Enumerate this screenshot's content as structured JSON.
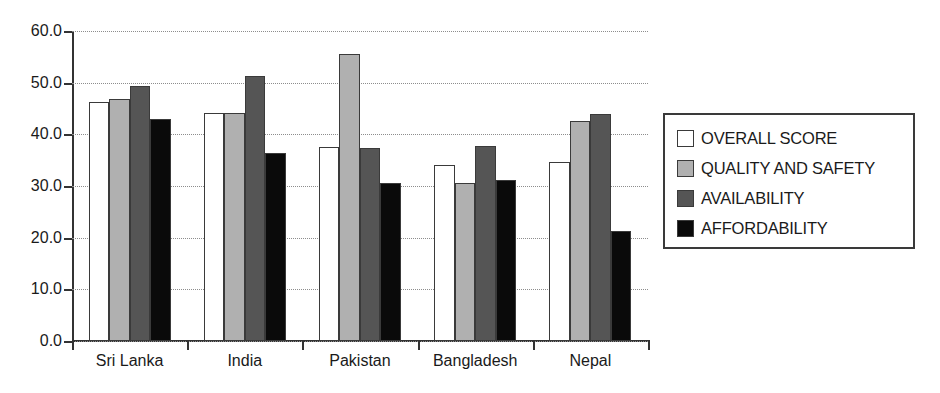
{
  "chart_data": {
    "type": "bar",
    "title": "",
    "subtitle": "",
    "xlabel": "",
    "ylabel": "",
    "ylim": [
      0.0,
      60.0
    ],
    "ytick_step": 10.0,
    "ytick_labels": [
      "60.0",
      "50.0",
      "40.0",
      "30.0",
      "20.0",
      "10.0",
      "0.0"
    ],
    "ytick_values": [
      60.0,
      50.0,
      40.0,
      30.0,
      20.0,
      10.0,
      0.0
    ],
    "grid": true,
    "grid_axis": "y",
    "grid_style": "dotted",
    "legend_position": "right",
    "categories": [
      "Sri Lanka",
      "India",
      "Pakistan",
      "Bangladesh",
      "Nepal"
    ],
    "series": [
      {
        "name": "OVERALL SCORE",
        "color": "#ffffff",
        "values": [
          46.2,
          44.2,
          37.6,
          34.0,
          34.6
        ]
      },
      {
        "name": "QUALITY AND SAFETY",
        "color": "#b0b0b0",
        "values": [
          46.8,
          44.2,
          55.5,
          30.5,
          42.6
        ]
      },
      {
        "name": "AVAILABILITY",
        "color": "#555555",
        "values": [
          49.3,
          51.3,
          37.4,
          37.7,
          43.9
        ]
      },
      {
        "name": "AFFORDABILITY",
        "color": "#0a0a0a",
        "values": [
          42.9,
          36.4,
          30.6,
          31.1,
          21.2
        ]
      }
    ]
  },
  "colors": {
    "axis": "#333333",
    "grid": "#8d8d8d",
    "bar_outline": "#3a3a3a",
    "background": "#ffffff",
    "text": "#1a1a1a"
  }
}
